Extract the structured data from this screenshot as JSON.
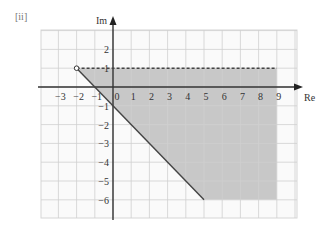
{
  "part_label": "[ii]",
  "chart_data": {
    "type": "region",
    "title": "",
    "xlabel": "Re",
    "ylabel": "Im",
    "xlim": [
      -4,
      10
    ],
    "ylim": [
      -7,
      4
    ],
    "grid": true,
    "x_ticks": [
      -3,
      -2,
      -1,
      0,
      1,
      2,
      3,
      4,
      5,
      6,
      7,
      8,
      9
    ],
    "y_ticks": [
      2,
      1,
      -1,
      -2,
      -3,
      -4,
      -5,
      -6
    ],
    "origin_label": "0",
    "boundaries": [
      {
        "name": "dashed-line",
        "style": "dashed",
        "from": [
          -2,
          1
        ],
        "to": [
          9,
          1
        ],
        "meaning": "Im(z) = 1 (excluded)"
      },
      {
        "name": "solid-ray",
        "style": "solid",
        "from": [
          -2,
          1
        ],
        "to": [
          5,
          -6
        ],
        "meaning": "arg(z + 2 - i) = -pi/4"
      }
    ],
    "open_point": [
      -2,
      1
    ],
    "shaded_region": {
      "polygon": [
        [
          -2,
          1
        ],
        [
          9,
          1
        ],
        [
          9,
          -6
        ],
        [
          5,
          -6
        ]
      ],
      "color": "#c8c8c8"
    }
  }
}
